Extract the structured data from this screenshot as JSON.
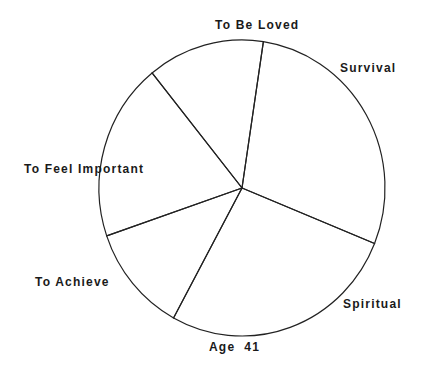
{
  "chart_data": {
    "type": "pie",
    "title": "Age 41",
    "start_angle_deg": 8.6,
    "direction": "clockwise",
    "categories": [
      "Survival",
      "Spiritual",
      "To Achieve",
      "To Feel Important",
      "To Be Loved"
    ],
    "values": [
      28.7,
      26.8,
      11.8,
      19.4,
      13.2
    ],
    "unit": "percent (estimated from slice angles)",
    "legend": "none (labels placed around pie)",
    "fill": "none",
    "stroke_color": "#222222",
    "background": "#ffffff"
  },
  "labels": {
    "survival": "Survival",
    "spiritual": "Spiritual",
    "to_achieve": "To Achieve",
    "to_feel_important": "To Feel Important",
    "to_be_loved": "To Be Loved",
    "title": "Age  41"
  }
}
